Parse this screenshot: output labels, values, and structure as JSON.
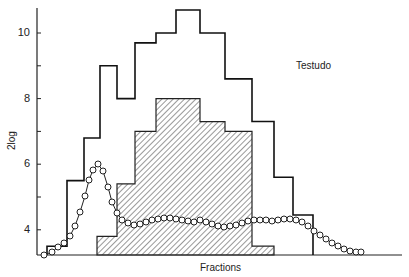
{
  "chart_data": {
    "type": "bar",
    "title": "",
    "annotation": "Testudo",
    "xlabel": "Fractions",
    "ylabel": "2log",
    "ylim": [
      3.2,
      10.8
    ],
    "yticks": [
      4,
      6,
      8,
      10
    ],
    "grid": false,
    "series": [
      {
        "name": "outer histogram (open)",
        "style": "step-outline",
        "x_edges_px": [
          47,
          67,
          84,
          100,
          117,
          135,
          156,
          176,
          200,
          225,
          252,
          274,
          293,
          313
        ],
        "values": [
          3.5,
          5.5,
          6.8,
          9.0,
          8.0,
          9.7,
          10.0,
          10.7,
          10.0,
          8.6,
          7.3,
          5.6,
          4.45
        ]
      },
      {
        "name": "inner histogram (hatched)",
        "style": "hatched",
        "x_edges_px": [
          97,
          117,
          135,
          156,
          200,
          225,
          252,
          274
        ],
        "values": [
          3.8,
          5.4,
          7.0,
          8.0,
          7.3,
          7.0,
          3.5
        ]
      },
      {
        "name": "open circles curve",
        "style": "line-with-circles",
        "points_px": [
          [
            44,
            255
          ],
          [
            52,
            252
          ],
          [
            58,
            247
          ],
          [
            64,
            243
          ],
          [
            70,
            236
          ],
          [
            75,
            226
          ],
          [
            80,
            212
          ],
          [
            85,
            196
          ],
          [
            89,
            180
          ],
          [
            93,
            170
          ],
          [
            98,
            164
          ],
          [
            103,
            171
          ],
          [
            108,
            187
          ],
          [
            112,
            202
          ],
          [
            117,
            213
          ],
          [
            122,
            220
          ],
          [
            128,
            223
          ],
          [
            134,
            225
          ],
          [
            140,
            224
          ],
          [
            146,
            222
          ],
          [
            152,
            220
          ],
          [
            158,
            219
          ],
          [
            164,
            218
          ],
          [
            170,
            218
          ],
          [
            176,
            219
          ],
          [
            182,
            220
          ],
          [
            188,
            221
          ],
          [
            194,
            222
          ],
          [
            200,
            220
          ],
          [
            206,
            222
          ],
          [
            212,
            224
          ],
          [
            218,
            226
          ],
          [
            224,
            227
          ],
          [
            230,
            226
          ],
          [
            236,
            225
          ],
          [
            242,
            223
          ],
          [
            248,
            221
          ],
          [
            254,
            220
          ],
          [
            260,
            220
          ],
          [
            266,
            220
          ],
          [
            272,
            221
          ],
          [
            278,
            220
          ],
          [
            284,
            219
          ],
          [
            290,
            219
          ],
          [
            296,
            220
          ],
          [
            302,
            222
          ],
          [
            308,
            226
          ],
          [
            314,
            231
          ],
          [
            320,
            235
          ],
          [
            326,
            239
          ],
          [
            332,
            243
          ],
          [
            338,
            246
          ],
          [
            344,
            249
          ],
          [
            350,
            251
          ],
          [
            356,
            252
          ],
          [
            361,
            252
          ]
        ]
      }
    ]
  }
}
